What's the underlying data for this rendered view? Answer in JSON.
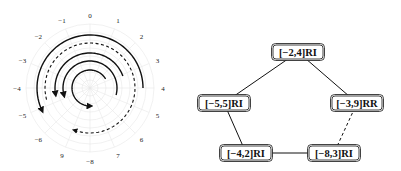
{
  "left_diagram": {
    "type": "polar-spiral",
    "center": [
      90,
      88
    ],
    "grid_color": "#e6e6e6",
    "angle_labels": [
      "0",
      "1",
      "2",
      "3",
      "4",
      "5",
      "6",
      "7",
      "-8",
      "9",
      "-6",
      "-5",
      "-4",
      "-3",
      "-2",
      "-1"
    ],
    "arcs": [
      {
        "radius": 52,
        "start_deg": 0,
        "end_deg": -100,
        "style": "solid",
        "arrow": "end"
      },
      {
        "radius": 44,
        "start_deg": 0,
        "end_deg": 150,
        "style": "dashed",
        "arrow": "end",
        "note": "outer dashed spiral"
      },
      {
        "radius": 34,
        "start_deg": 70,
        "end_deg": -90,
        "style": "solid",
        "arrow": "end"
      },
      {
        "radius": 26,
        "start_deg": 80,
        "end_deg": -110,
        "style": "solid",
        "arrow": "end"
      },
      {
        "radius": 18,
        "start_deg": 60,
        "end_deg": 180,
        "style": "solid",
        "arrow": "end"
      }
    ]
  },
  "right_diagram": {
    "type": "graph",
    "nodes": [
      {
        "id": "n1",
        "label": "[−2,4]RI",
        "cx": 298,
        "cy": 52
      },
      {
        "id": "n2",
        "label": "[−5,5]RI",
        "cx": 224,
        "cy": 103
      },
      {
        "id": "n3",
        "label": "[−3,9]RR",
        "cx": 357,
        "cy": 103
      },
      {
        "id": "n4",
        "label": "[−4,2]RI",
        "cx": 246,
        "cy": 153
      },
      {
        "id": "n5",
        "label": "[−8,3]RI",
        "cx": 334,
        "cy": 153
      }
    ],
    "edges": [
      {
        "from": "n1",
        "to": "n2",
        "style": "solid"
      },
      {
        "from": "n1",
        "to": "n3",
        "style": "solid"
      },
      {
        "from": "n2",
        "to": "n4",
        "style": "solid"
      },
      {
        "from": "n4",
        "to": "n5",
        "style": "solid"
      },
      {
        "from": "n3",
        "to": "n5",
        "style": "dashed"
      }
    ]
  }
}
